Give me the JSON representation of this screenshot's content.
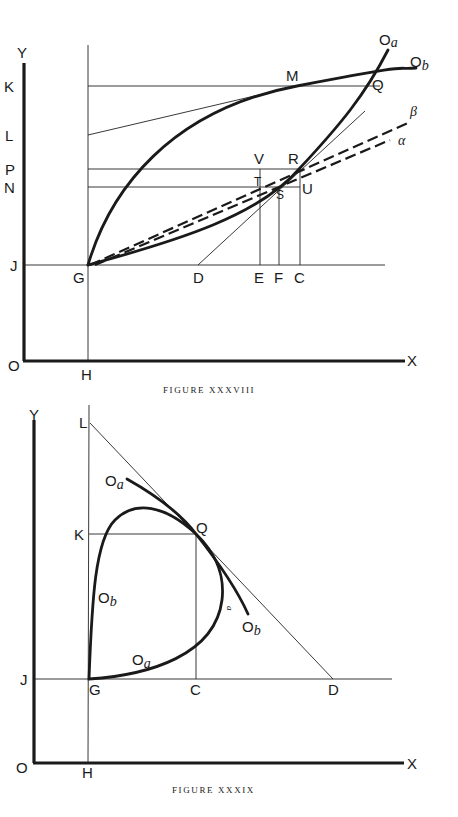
{
  "figures": [
    {
      "caption": "FIGURE XXXVIII",
      "axis_labels": {
        "y": "Y",
        "x": "X",
        "origin": "O"
      },
      "point_labels": {
        "K": "K",
        "L": "L",
        "P": "P",
        "N": "N",
        "J": "J",
        "G": "G",
        "H": "H",
        "M": "M",
        "Q": "Q",
        "R": "R",
        "U": "U",
        "V": "V",
        "T": "T",
        "S": "S",
        "D": "D",
        "E": "E",
        "F": "F",
        "C": "C"
      },
      "curve_labels": {
        "oa": "O",
        "oa_sub": "a",
        "ob": "O",
        "ob_sub": "b",
        "beta": "β",
        "alpha": "α"
      }
    },
    {
      "caption": "FIGURE XXXIX",
      "axis_labels": {
        "y": "Y",
        "x": "X",
        "origin": "O"
      },
      "point_labels": {
        "L": "L",
        "K": "K",
        "Q": "Q",
        "J": "J",
        "G": "G",
        "C": "C",
        "D": "D",
        "H": "H"
      },
      "curve_labels": {
        "oa_top": "O",
        "oa_top_sub": "a",
        "ob_left": "O",
        "ob_left_sub": "b",
        "oa_bottom": "O",
        "oa_bottom_sub": "a",
        "ob_right": "O",
        "ob_right_sub": "b",
        "small_a": "a"
      }
    }
  ]
}
